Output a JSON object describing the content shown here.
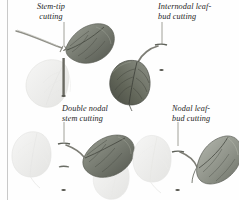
{
  "figure": {
    "kind": "botanical-illustration",
    "background_color": "#fefefe",
    "page_rule_color": "#c9c9c9",
    "ink_color": "#1d1d1d",
    "leaf_dark_color": "#6e7268",
    "leaf_mid_color": "#8e9287",
    "leaf_ghost_color": "#ececec",
    "stem_color": "#7b7b72"
  },
  "labels": {
    "stem_tip": "Stem-tip\ncutting",
    "internodal": "Internodal leaf-\nbud cutting",
    "double_nodal": "Double nodal\nstem cutting",
    "nodal": "Nodal leaf-\nbud cutting"
  },
  "specimens": [
    {
      "id": "stem-tip",
      "label": "Stem-tip cutting",
      "position": "top-left",
      "leaves_dark": 1,
      "leaves_ghost": 1,
      "has_leader_line": true
    },
    {
      "id": "internodal-leaf-bud",
      "label": "Internodal leaf-bud cutting",
      "position": "top-right",
      "leaves_dark": 1,
      "leaves_ghost": 0,
      "has_leader_line": true
    },
    {
      "id": "double-nodal-stem",
      "label": "Double nodal stem cutting",
      "position": "bottom-left",
      "leaves_dark": 1,
      "leaves_ghost": 2,
      "has_leader_line": true
    },
    {
      "id": "nodal-leaf-bud",
      "label": "Nodal leaf-bud cutting",
      "position": "bottom-right",
      "leaves_dark": 1,
      "leaves_ghost": 1,
      "has_leader_line": true
    }
  ]
}
